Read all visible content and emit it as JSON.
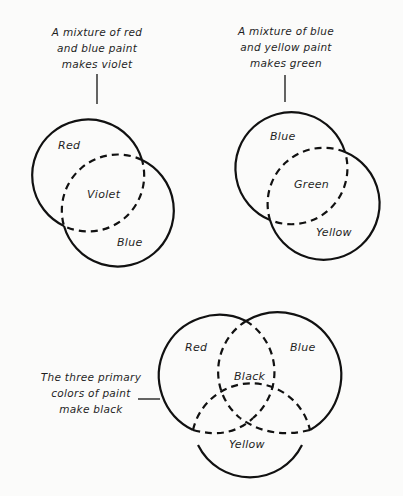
{
  "diagrams": [
    {
      "id": "red-blue",
      "caption_lines": [
        "A mixture of red",
        "and blue paint",
        "makes violet"
      ],
      "circles": [
        {
          "label": "Red",
          "color": "#111111"
        },
        {
          "label": "Blue",
          "color": "#111111"
        }
      ],
      "overlap_label": "Violet"
    },
    {
      "id": "blue-yellow",
      "caption_lines": [
        "A mixture of blue",
        "and yellow paint",
        "makes green"
      ],
      "circles": [
        {
          "label": "Blue",
          "color": "#111111"
        },
        {
          "label": "Yellow",
          "color": "#111111"
        }
      ],
      "overlap_label": "Green"
    },
    {
      "id": "three-primaries",
      "caption_lines": [
        "The three primary",
        "colors of paint",
        "make black"
      ],
      "circles": [
        {
          "label": "Red",
          "color": "#111111"
        },
        {
          "label": "Blue",
          "color": "#111111"
        },
        {
          "label": "Yellow",
          "color": "#111111"
        }
      ],
      "overlap_label": "Black"
    }
  ],
  "style": {
    "background": "#fbfbfa",
    "stroke": "#111111"
  }
}
